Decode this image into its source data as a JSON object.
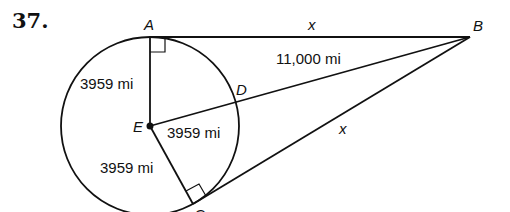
{
  "problem": {
    "number": "37."
  },
  "points": {
    "A": "A",
    "B": "B",
    "C": "C",
    "D": "D",
    "E": "E"
  },
  "measures": {
    "EA": "3959 mi",
    "ED": "3959 mi",
    "EC": "3959 mi",
    "BE": "11,000 mi",
    "AB": "x",
    "CB": "x"
  },
  "figure": {
    "stroke_color": "#111111",
    "background": "#ffffff"
  }
}
